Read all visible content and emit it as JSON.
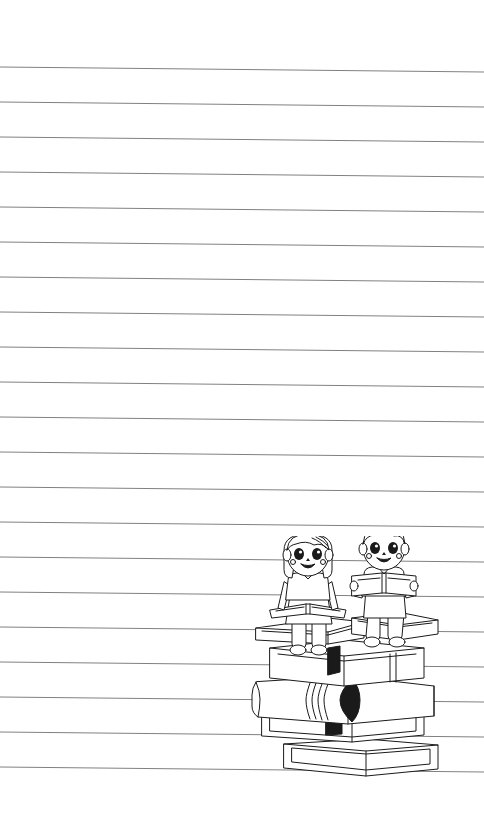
{
  "page": {
    "title": "Lined writing paper with books illustration",
    "kind": "coloring-page",
    "width": 484,
    "height": 819,
    "background_color": "#ffffff"
  },
  "ruled_lines": {
    "name": "handwriting-ruled-lines",
    "count": 21,
    "color": "#808080",
    "stroke_width": 1,
    "first_line_y_left": 67,
    "spacing": 35,
    "tilt_drop_right": 5,
    "x_start": 0,
    "x_end": 484
  },
  "illustration": {
    "name": "children-on-book-stack",
    "caption": "Two children sitting on a stack of books, reading",
    "line_color": "#1a1a1a",
    "fill_color": "#ffffff",
    "stroke_width": 1,
    "figures": [
      {
        "name": "girl-reading",
        "description": "Girl with long hair and bangs, sitting cross-legged with an open book on her lap",
        "features": [
          "bangs",
          "long-hair",
          "short-sleeve-top",
          "open-book-on-lap",
          "shoes"
        ]
      },
      {
        "name": "boy-reading",
        "description": "Boy with short hair and a cowlick, holding an open book in front of his chest",
        "features": [
          "cowlick",
          "short-hair",
          "collared-shirt",
          "open-book-held-up",
          "shoes"
        ]
      }
    ],
    "book_stack": {
      "name": "stack-of-books",
      "book_count": 6,
      "books": [
        {
          "name": "book-top-left-thin",
          "description": "thin book under the girl"
        },
        {
          "name": "book-top-right-thin",
          "description": "thin book under the boy"
        },
        {
          "name": "book-second-wide",
          "description": "wide open-edge book with visible page block"
        },
        {
          "name": "book-third-thick",
          "description": "thick rounded-spine book with page lines"
        },
        {
          "name": "book-fourth-hollow",
          "description": "book with dark hollow page recess"
        },
        {
          "name": "book-bottom-base",
          "description": "bottom-most base book"
        }
      ]
    }
  }
}
